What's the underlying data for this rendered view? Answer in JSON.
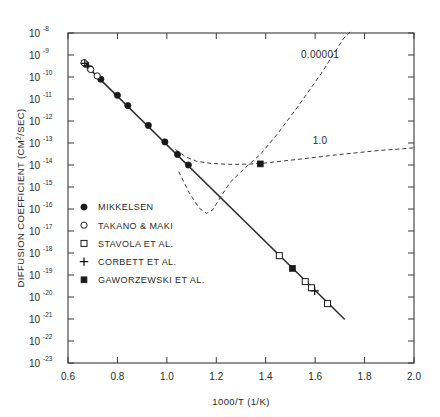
{
  "chart_data": {
    "type": "scatter",
    "title": "",
    "xlabel": "1000/T (1/K)",
    "ylabel": "DIFFUSION COEFFICIENT (CM2/SEC)",
    "ylabel_base": "DIFFUSION COEFFICIENT (CM",
    "ylabel_sup": "2",
    "ylabel_tail": "/SEC)",
    "xscale": "linear",
    "yscale": "log",
    "xlim": [
      0.6,
      2.0
    ],
    "ylim_exp": [
      -23,
      -8
    ],
    "grid": false,
    "xticks": [
      0.6,
      0.8,
      1.0,
      1.2,
      1.4,
      1.6,
      1.8,
      2.0
    ],
    "xticklabels": [
      "0.6",
      "0.8",
      "1.0",
      "1.2",
      "1.4",
      "1.6",
      "1.8",
      "2.0"
    ],
    "ytick_exponents": [
      -8,
      -9,
      -10,
      -11,
      -12,
      -13,
      -14,
      -15,
      -16,
      -17,
      -18,
      -19,
      -20,
      -21,
      -22,
      -23
    ],
    "ytick_mantissa": "10",
    "ytick_labels": [
      "10-8",
      "10-9",
      "10-10",
      "10-11",
      "10-12",
      "10-13",
      "10-14",
      "10-15",
      "10-16",
      "10-17",
      "10-18",
      "10-19",
      "10-20",
      "10-21",
      "10-22",
      "10-23"
    ],
    "legend": {
      "position": "lower-left-inside",
      "entries": [
        {
          "label": "MIKKELSEN",
          "marker": "filled-circle"
        },
        {
          "label": "TAKANO & MAKI",
          "marker": "open-circle"
        },
        {
          "label": "STAVOLA ET AL.",
          "marker": "open-square"
        },
        {
          "label": "CORBETT ET AL.",
          "marker": "plus"
        },
        {
          "label": "GAWORZEWSKI ET AL.",
          "marker": "filled-square"
        }
      ]
    },
    "annotations": [
      {
        "text": "0.00001",
        "x": 1.62,
        "y_exp": -9.15,
        "curve": "trap-limited-low-conc"
      },
      {
        "text": "1.0",
        "x": 1.62,
        "y_exp": -13.05,
        "curve": "trap-limited-high-conc"
      }
    ],
    "series": [
      {
        "name": "MIKKELSEN",
        "marker": "filled-circle",
        "points": [
          {
            "x": 0.672,
            "y_exp": -9.42
          },
          {
            "x": 0.69,
            "y_exp": -9.62
          },
          {
            "x": 0.733,
            "y_exp": -10.1
          },
          {
            "x": 0.8,
            "y_exp": -10.83
          },
          {
            "x": 0.842,
            "y_exp": -11.3
          },
          {
            "x": 0.925,
            "y_exp": -12.2
          },
          {
            "x": 0.992,
            "y_exp": -12.95
          },
          {
            "x": 1.043,
            "y_exp": -13.52
          },
          {
            "x": 1.087,
            "y_exp": -14.0
          }
        ]
      },
      {
        "name": "TAKANO & MAKI",
        "marker": "open-circle",
        "points": [
          {
            "x": 0.665,
            "y_exp": -9.35
          },
          {
            "x": 0.692,
            "y_exp": -9.66
          },
          {
            "x": 0.718,
            "y_exp": -9.95
          }
        ]
      },
      {
        "name": "STAVOLA ET AL.",
        "marker": "open-square",
        "points": [
          {
            "x": 1.455,
            "y_exp": -18.12
          },
          {
            "x": 1.56,
            "y_exp": -19.3
          },
          {
            "x": 1.585,
            "y_exp": -19.58
          },
          {
            "x": 1.65,
            "y_exp": -20.3
          }
        ]
      },
      {
        "name": "CORBETT ET AL.",
        "marker": "plus",
        "points": [
          {
            "x": 0.668,
            "y_exp": -9.38
          },
          {
            "x": 1.598,
            "y_exp": -19.72
          }
        ]
      },
      {
        "name": "GAWORZEWSKI ET AL.",
        "marker": "filled-square",
        "points": [
          {
            "x": 1.378,
            "y_exp": -13.95
          },
          {
            "x": 1.508,
            "y_exp": -18.7
          }
        ]
      }
    ],
    "fit_line": {
      "name": "Arrhenius fit",
      "style": "solid",
      "x_start": 0.655,
      "y_exp_start": -9.28,
      "x_end": 1.718,
      "y_exp_end": -21.0
    },
    "dashed_curves": [
      {
        "name": "trap-limited-high-conc",
        "label": "1.0",
        "style": "dashed",
        "points": [
          {
            "x": 1.035,
            "y_exp": -13.3
          },
          {
            "x": 1.075,
            "y_exp": -13.62
          },
          {
            "x": 1.12,
            "y_exp": -13.83
          },
          {
            "x": 1.18,
            "y_exp": -13.93
          },
          {
            "x": 1.25,
            "y_exp": -13.97
          },
          {
            "x": 1.33,
            "y_exp": -13.96
          },
          {
            "x": 1.38,
            "y_exp": -13.93
          },
          {
            "x": 1.47,
            "y_exp": -13.82
          },
          {
            "x": 1.58,
            "y_exp": -13.68
          },
          {
            "x": 1.7,
            "y_exp": -13.52
          },
          {
            "x": 1.85,
            "y_exp": -13.35
          },
          {
            "x": 2.0,
            "y_exp": -13.22
          }
        ]
      },
      {
        "name": "trap-limited-low-conc",
        "label": "0.00001",
        "style": "dashed",
        "points": [
          {
            "x": 1.048,
            "y_exp": -14.3
          },
          {
            "x": 1.09,
            "y_exp": -15.25
          },
          {
            "x": 1.13,
            "y_exp": -15.95
          },
          {
            "x": 1.16,
            "y_exp": -16.2
          },
          {
            "x": 1.185,
            "y_exp": -16.05
          },
          {
            "x": 1.215,
            "y_exp": -15.5
          },
          {
            "x": 1.255,
            "y_exp": -14.8
          },
          {
            "x": 1.31,
            "y_exp": -14.2
          },
          {
            "x": 1.38,
            "y_exp": -13.5
          },
          {
            "x": 1.45,
            "y_exp": -12.55
          },
          {
            "x": 1.52,
            "y_exp": -11.5
          },
          {
            "x": 1.58,
            "y_exp": -10.55
          },
          {
            "x": 1.63,
            "y_exp": -9.75
          },
          {
            "x": 1.672,
            "y_exp": -9.0
          },
          {
            "x": 1.715,
            "y_exp": -8.25
          },
          {
            "x": 1.742,
            "y_exp": -7.95
          }
        ]
      }
    ]
  }
}
